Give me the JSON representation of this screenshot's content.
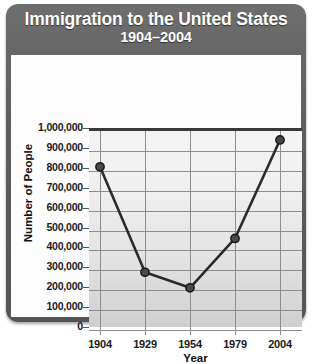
{
  "chart_data": {
    "type": "line",
    "title": "Immigration to the United States",
    "subtitle": "1904–2004",
    "xlabel": "Year",
    "ylabel": "Number of People",
    "categories": [
      "1904",
      "1929",
      "1954",
      "1979",
      "2004"
    ],
    "x": [
      1904,
      1929,
      1954,
      1979,
      2004
    ],
    "values": [
      820000,
      290000,
      212000,
      460000,
      955000
    ],
    "series": [
      {
        "name": "Immigration to the United States",
        "values": [
          820000,
          290000,
          212000,
          460000,
          955000
        ]
      }
    ],
    "ylim": [
      0,
      1000000
    ],
    "ytick_step": 100000,
    "ytick_labels": [
      "1,000,000",
      "900,000",
      "800,000",
      "700,000",
      "600,000",
      "500,000",
      "400,000",
      "300,000",
      "200,000",
      "100,000",
      "0"
    ],
    "ytick_values": [
      1000000,
      900000,
      800000,
      700000,
      600000,
      500000,
      400000,
      300000,
      200000,
      100000,
      0
    ],
    "xtick_labels": [
      "1904",
      "1929",
      "1954",
      "1979",
      "2004"
    ],
    "grid": "both",
    "legend": "none",
    "colors": {
      "frame": "#5d5d5d",
      "title_text": "#ffffff",
      "plot_background": "#e8e8e8",
      "gridline": "#8d8d8d",
      "line": "#2b2b2b",
      "marker_fill": "#3a3a3a",
      "axis_text": "#1a1a1a"
    }
  }
}
